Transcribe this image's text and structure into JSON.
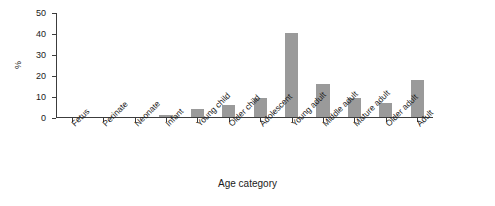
{
  "chart_data": {
    "type": "bar",
    "title": "",
    "subtitle": "",
    "xlabel": "Age category",
    "ylabel": "%",
    "categories": [
      "Fetus",
      "Perinate",
      "Neonate",
      "Infant",
      "Young child",
      "Older child",
      "Adolescent",
      "Young adult",
      "Middle adult",
      "Mature adult",
      "Older adult",
      "Adult"
    ],
    "values": [
      0,
      0,
      0,
      1,
      4,
      5.5,
      9,
      40,
      15.5,
      9,
      6.5,
      17.5
    ],
    "ylim": [
      0,
      50
    ],
    "yticks": [
      0,
      10,
      20,
      30,
      40,
      50
    ],
    "ytick_labels": [
      "0",
      "10",
      "20",
      "30",
      "40",
      "50"
    ],
    "grid": false,
    "legend": null,
    "bar_color": "#9a9a9a",
    "axis_color": "#3c3c3c",
    "background_color": "#ffffff"
  }
}
